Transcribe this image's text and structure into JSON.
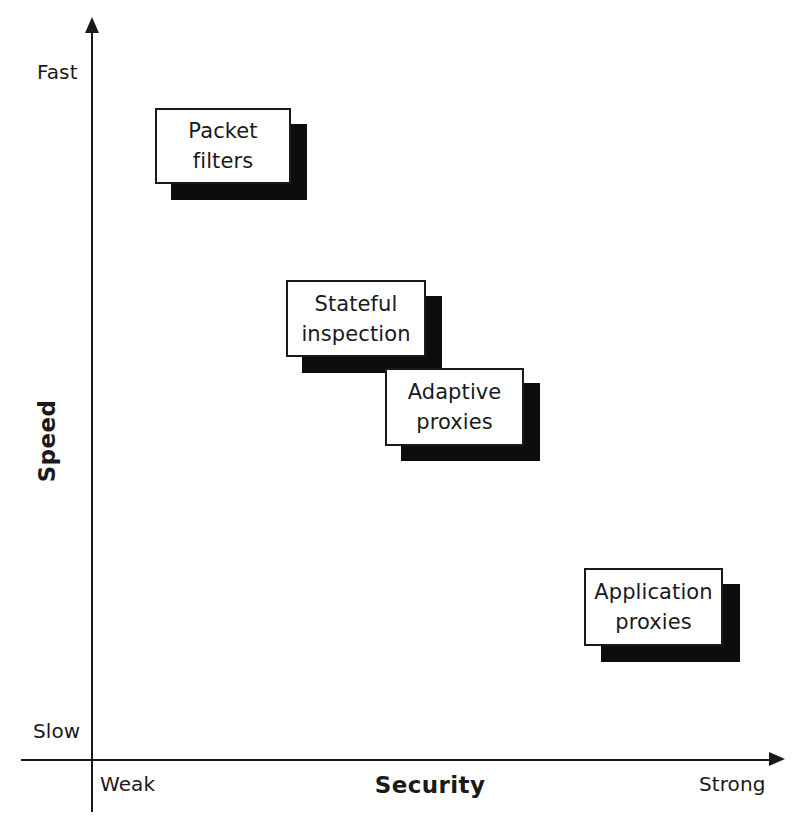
{
  "chart_data": {
    "type": "scatter",
    "title": "",
    "xlabel": "Security",
    "ylabel": "Speed",
    "x_axis": {
      "label": "Security",
      "min_label": "Weak",
      "max_label": "Strong",
      "direction": "left-to-right increasing",
      "arrow": true
    },
    "y_axis": {
      "label": "Speed",
      "min_label": "Slow",
      "max_label": "Fast",
      "direction": "bottom-to-top increasing",
      "arrow": true
    },
    "grid": false,
    "legend": null,
    "annotations": [],
    "points": [
      {
        "label": "Packet filters",
        "security": "weak",
        "speed": "fast",
        "x": 0.12,
        "y": 0.9
      },
      {
        "label": "Stateful inspection",
        "security": "moderate",
        "speed": "moderately fast",
        "x": 0.33,
        "y": 0.66
      },
      {
        "label": "Adaptive proxies",
        "security": "moderate-strong",
        "speed": "moderate",
        "x": 0.47,
        "y": 0.55
      },
      {
        "label": "Application proxies",
        "security": "strong",
        "speed": "slow",
        "x": 0.78,
        "y": 0.27
      }
    ]
  },
  "figure": {
    "axis_titles": {
      "vertical": "Speed",
      "horizontal": "Security"
    },
    "axis_ticks": {
      "y_top": "Fast",
      "y_bottom": "Slow",
      "x_left": "Weak",
      "x_right": "Strong"
    },
    "boxes": [
      {
        "line1": "Packet",
        "line2": "filters"
      },
      {
        "line1": "Stateful",
        "line2": "inspection"
      },
      {
        "line1": "Adaptive",
        "line2": "proxies"
      },
      {
        "line1": "Application",
        "line2": "proxies"
      }
    ],
    "colors": {
      "background": "#ffffff",
      "ink": "#1a1a1a",
      "shadow": "#0d0d0d",
      "box_fill": "#ffffff"
    }
  }
}
